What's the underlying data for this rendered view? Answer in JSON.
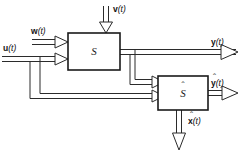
{
  "diagram": {
    "background_color": "#ffffff",
    "line_color": "#2b2b2b",
    "block_border_color": "#1a1a1a",
    "blocks": [
      {
        "id": "plant",
        "label": "S",
        "has_hat": false,
        "x": 68,
        "y": 33,
        "w": 52,
        "h": 37
      },
      {
        "id": "estimator",
        "label": "S",
        "has_hat": true,
        "x": 158,
        "y": 76,
        "w": 50,
        "h": 34
      }
    ],
    "signals": [
      {
        "id": "disturbance",
        "symbol": "v",
        "arg": "(t)",
        "label": "v(t)",
        "has_hat": false,
        "direction": "down",
        "role": "input-to-plant"
      },
      {
        "id": "noise",
        "symbol": "w",
        "arg": "(t)",
        "label": "w(t)",
        "has_hat": false,
        "direction": "right",
        "role": "input-to-plant"
      },
      {
        "id": "control",
        "symbol": "u",
        "arg": "(t)",
        "label": "u(t)",
        "has_hat": false,
        "direction": "right",
        "role": "input-to-plant-and-estimator"
      },
      {
        "id": "output",
        "symbol": "y",
        "arg": "(t)",
        "label": "y(t)",
        "has_hat": false,
        "direction": "right",
        "role": "output-of-plant"
      },
      {
        "id": "output-estimate",
        "symbol": "y",
        "arg": "(t)",
        "label": "y(t)",
        "has_hat": true,
        "direction": "right",
        "role": "output-of-estimator"
      },
      {
        "id": "state-estimate",
        "symbol": "x",
        "arg": "(t)",
        "label": "x(t)",
        "has_hat": true,
        "direction": "down",
        "role": "output-of-estimator"
      }
    ]
  }
}
